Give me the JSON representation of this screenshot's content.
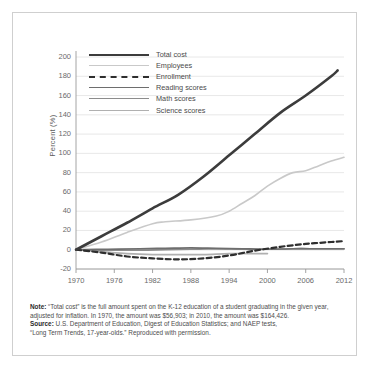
{
  "chart_data": {
    "type": "line",
    "title": "",
    "xlabel": "",
    "ylabel": "Percent (%)",
    "xlim": [
      1970,
      2012
    ],
    "ylim": [
      -20,
      200
    ],
    "yticks": [
      200,
      180,
      160,
      140,
      120,
      100,
      80,
      60,
      40,
      20,
      0,
      -20
    ],
    "xticks": [
      1970,
      1976,
      1982,
      1988,
      1994,
      2000,
      2006,
      2012
    ],
    "grid": true,
    "legend_position": "upper-left-inside",
    "series": [
      {
        "name": "Total cost",
        "color": "#3c3c3c",
        "style": "solid",
        "width": 2.6,
        "x": [
          1970,
          1974,
          1978,
          1982,
          1986,
          1990,
          1994,
          1998,
          2002,
          2006,
          2010,
          2011
        ],
        "values": [
          0,
          14,
          28,
          43,
          57,
          76,
          98,
          120,
          142,
          160,
          180,
          186
        ]
      },
      {
        "name": "Employees",
        "color": "#c9c9c9",
        "style": "solid",
        "width": 1.6,
        "x": [
          1970,
          1974,
          1978,
          1982,
          1984,
          1988,
          1992,
          1994,
          1996,
          1998,
          2000,
          2002,
          2004,
          2006,
          2008,
          2010,
          2012
        ],
        "values": [
          0,
          8,
          18,
          27,
          29,
          31,
          35,
          40,
          48,
          56,
          66,
          74,
          80,
          82,
          87,
          92,
          96
        ]
      },
      {
        "name": "Enrollment",
        "color": "#2e2e2e",
        "style": "dashed",
        "width": 2.2,
        "x": [
          1970,
          1974,
          1978,
          1982,
          1986,
          1990,
          1994,
          1998,
          2002,
          2006,
          2010,
          2012
        ],
        "values": [
          0,
          -3,
          -7,
          -9,
          -10,
          -9,
          -6,
          -1,
          3,
          6,
          8,
          9
        ]
      },
      {
        "name": "Reading scores",
        "color": "#6e6e6e",
        "style": "solid",
        "width": 1.7,
        "x": [
          1970,
          1975,
          1980,
          1984,
          1988,
          1992,
          1996,
          2000,
          2004,
          2008,
          2012
        ],
        "values": [
          0,
          0.5,
          1,
          1.5,
          2,
          1.5,
          1,
          0.5,
          1,
          1,
          1
        ]
      },
      {
        "name": "Math scores",
        "color": "#8c8c8c",
        "style": "solid",
        "width": 1.7,
        "x": [
          1970,
          1975,
          1980,
          1984,
          1988,
          1992,
          1996,
          2000,
          2004,
          2008,
          2012
        ],
        "values": [
          0,
          -0.5,
          -0.5,
          0,
          0.5,
          1,
          0.5,
          0.5,
          1,
          1,
          1
        ]
      },
      {
        "name": "Science scores",
        "color": "#b0b0b0",
        "style": "solid",
        "width": 1.7,
        "x": [
          1970,
          1974,
          1978,
          1982,
          1986,
          1990,
          1994,
          1998,
          2000
        ],
        "values": [
          0,
          -2,
          -4,
          -5,
          -5,
          -5,
          -4,
          -4,
          -4
        ]
      }
    ]
  },
  "legend": {
    "items": [
      {
        "label": "Total cost"
      },
      {
        "label": "Employees"
      },
      {
        "label": "Enrollment"
      },
      {
        "label": "Reading scores"
      },
      {
        "label": "Math scores"
      },
      {
        "label": "Science scores"
      }
    ]
  },
  "notes": {
    "note_label": "Note:",
    "note_line1": " “Total cost” is the full amount spent on the K-12 education of a student graduating in the given year,",
    "note_line2": "adjusted for inflation. In 1970, the amount was $56,903; in 2010, the amount was $164,426.",
    "source_label": "Source:",
    "source_line1": " U.S. Department of Education, Digest of Education Statistics; and NAEP tests,",
    "source_line2": "“Long Term Trends, 17-year-olds.” Reproduced with permission."
  }
}
